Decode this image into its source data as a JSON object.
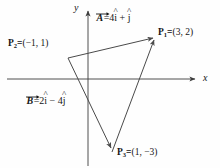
{
  "figure": {
    "kind": "vector-diagram",
    "background_color": "#fefefe",
    "stroke_color": "#4a4a4a",
    "text_color": "#151515",
    "axes": {
      "x_label": "x",
      "y_label": "y",
      "origin": {
        "x": 88,
        "y": 79
      }
    },
    "points": [
      {
        "key": "P1",
        "name": "P",
        "subscript": "1",
        "equals": "=",
        "value": "(3, 2)",
        "full_label": "P₁ = (3, 2)",
        "plot": {
          "x": 156,
          "y": 37
        }
      },
      {
        "key": "P2",
        "name": "P",
        "subscript": "2",
        "equals": "=",
        "value": "(−1, 1)",
        "full_label": "P₂ = (−1, 1)",
        "plot": {
          "x": 68,
          "y": 58
        }
      },
      {
        "key": "P3",
        "name": "P",
        "subscript": "3",
        "equals": "=",
        "value": "(1, −3)",
        "full_label": "P₃ = (1, −3)",
        "plot": {
          "x": 112,
          "y": 152
        }
      }
    ],
    "vectors": [
      {
        "key": "A",
        "name": "A",
        "equals": "=",
        "i_coeff": "4",
        "i_symbol": "i",
        "operator": "+",
        "j_coeff": "",
        "j_symbol": "j",
        "full_label": "A⃗ = 4î + ĵ",
        "from": "P2",
        "to": "P1"
      },
      {
        "key": "B",
        "name": "B",
        "equals": "=",
        "i_coeff": "2",
        "i_symbol": "i",
        "operator": "−",
        "j_coeff": "4",
        "j_symbol": "j",
        "full_label": "B⃗ = 2î − 4ĵ",
        "from": "P2",
        "to": "P3"
      }
    ]
  }
}
